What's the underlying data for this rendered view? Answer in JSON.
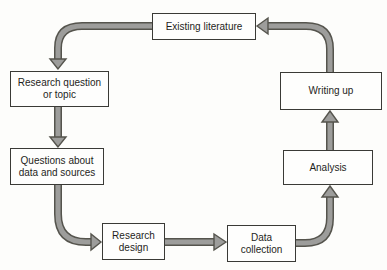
{
  "diagram": {
    "type": "cycle-flowchart",
    "nodes": [
      {
        "id": "existing-literature",
        "label": "Existing literature"
      },
      {
        "id": "research-question-or-topic",
        "label": "Research question or topic"
      },
      {
        "id": "questions-about-data-and-sources",
        "label": "Questions about data and sources"
      },
      {
        "id": "research-design",
        "label": "Research design"
      },
      {
        "id": "data-collection",
        "label": "Data collection"
      },
      {
        "id": "analysis",
        "label": "Analysis"
      },
      {
        "id": "writing-up",
        "label": "Writing up"
      }
    ],
    "edges": [
      {
        "from": "existing-literature",
        "to": "research-question-or-topic"
      },
      {
        "from": "research-question-or-topic",
        "to": "questions-about-data-and-sources"
      },
      {
        "from": "questions-about-data-and-sources",
        "to": "research-design"
      },
      {
        "from": "research-design",
        "to": "data-collection"
      },
      {
        "from": "data-collection",
        "to": "analysis"
      },
      {
        "from": "analysis",
        "to": "writing-up"
      },
      {
        "from": "writing-up",
        "to": "existing-literature"
      }
    ]
  },
  "colors": {
    "bg": "#fdfdfb",
    "box-bg": "#fefefd",
    "box-border": "#3a3a36",
    "text": "#1e1e1c",
    "arrow-fill": "#9d9d9b",
    "arrow-outline": "#55544d"
  }
}
